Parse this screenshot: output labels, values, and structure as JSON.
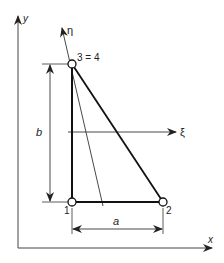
{
  "figure": {
    "type": "triangular finite element in local and global coordinates",
    "axes": {
      "global_x_label": "x",
      "global_y_label": "y",
      "local_xi_label": "ξ",
      "local_eta_label": "η"
    },
    "nodes": [
      {
        "id": "1",
        "label": "1"
      },
      {
        "id": "2",
        "label": "2"
      },
      {
        "id": "3",
        "label": "3 = 4"
      }
    ],
    "dimensions": {
      "width_label": "a",
      "height_label": "b"
    },
    "colors": {
      "line": "#222222",
      "background": "#ffffff"
    }
  }
}
